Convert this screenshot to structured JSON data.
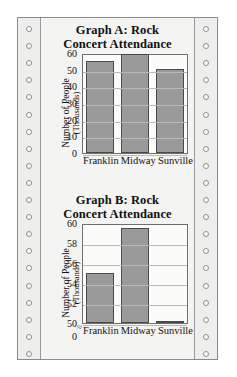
{
  "page": {
    "medium": "continuous-form-perforated-paper",
    "sprocket_hole_count": 20
  },
  "chart_data": [
    {
      "id": "graph-a",
      "type": "bar",
      "title": "Graph A: Rock Concert Attendance",
      "title_line1": "Graph A: Rock",
      "title_line2": "Concert Attendance",
      "categories": [
        "Franklin",
        "Midway",
        "Sunville"
      ],
      "values": [
        55,
        59.5,
        50.2
      ],
      "xlabel": "",
      "ylabel": "Number of People",
      "ylabel_sub": "(Thousands)",
      "ylim": [
        0,
        60
      ],
      "yticks": [
        0,
        10,
        20,
        30,
        40,
        50,
        60
      ],
      "axis_break": false,
      "grid": true,
      "legend": "none",
      "bar_color": "#9a9a9a",
      "bar_border_color": "#4a4a4a"
    },
    {
      "id": "graph-b",
      "type": "bar",
      "title": "Graph B: Rock Concert Attendance",
      "title_line1": "Graph B: Rock",
      "title_line2": "Concert Attendance",
      "categories": [
        "Franklin",
        "Midway",
        "Sunville"
      ],
      "values": [
        55,
        59.5,
        50.2
      ],
      "xlabel": "",
      "ylabel": "Number of People",
      "ylabel_sub": "(Thousands)",
      "ylim": [
        50,
        60
      ],
      "yticks": [
        0,
        50,
        52,
        54,
        56,
        58,
        60
      ],
      "axis_break": true,
      "axis_break_glyph": "≈",
      "grid": true,
      "legend": "none",
      "bar_color": "#9a9a9a",
      "bar_border_color": "#4a4a4a"
    }
  ]
}
